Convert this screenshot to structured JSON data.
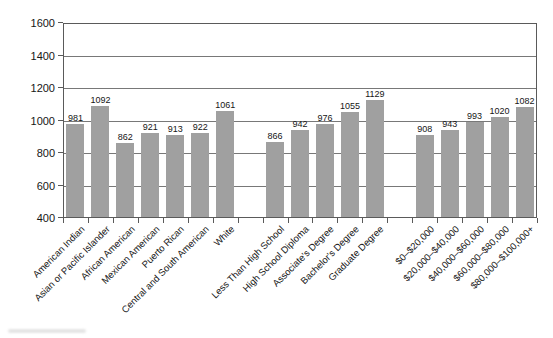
{
  "figure": {
    "background": "#ffffff",
    "text_color": "#161616"
  },
  "chart_data": {
    "type": "bar",
    "title": "",
    "xlabel": "",
    "ylabel": "",
    "ylim": [
      400,
      1600
    ],
    "yticks": [
      400,
      600,
      800,
      1000,
      1200,
      1400,
      1600
    ],
    "grid": "horizontal",
    "legend": "none",
    "bar_color": "#a0a0a0",
    "value_labels_shown": true,
    "group_gap_slots": 1,
    "groups": [
      {
        "name": "race-ethnicity",
        "categories": [
          "American Indian",
          "Asian or Pacific Islander",
          "African American",
          "Mexican American",
          "Puerto Rican",
          "Central and South American",
          "White"
        ],
        "values": [
          981,
          1092,
          862,
          921,
          913,
          922,
          1061
        ]
      },
      {
        "name": "education",
        "categories": [
          "Less Than High School",
          "High School Diploma",
          "Associate's Degree",
          "Bachelor's Degree",
          "Graduate Degree"
        ],
        "values": [
          866,
          942,
          976,
          1055,
          1129
        ]
      },
      {
        "name": "income",
        "categories": [
          "$0–$20,000",
          "$20,000–$40,000",
          "$40,000–$60,000",
          "$60,000–$80,000",
          "$80,000–$100,000+"
        ],
        "values": [
          908,
          943,
          993,
          1020,
          1082
        ]
      }
    ]
  }
}
